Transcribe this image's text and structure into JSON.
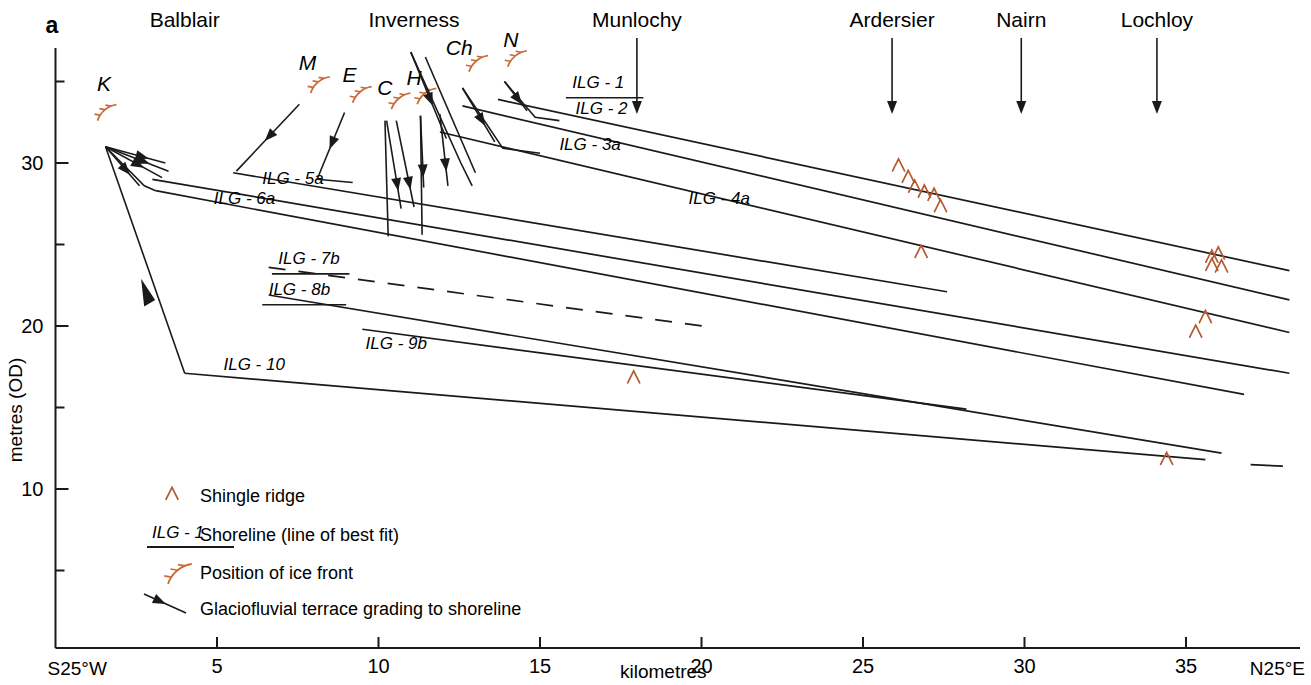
{
  "panel_label": "a",
  "axes": {
    "y_axis_title": "metres (OD)",
    "x_axis_title": "kilometres",
    "x_start_label": "S25°W",
    "x_end_label": "N25°E",
    "y_ticks_major": [
      30,
      20,
      10
    ],
    "y_ticks_minor": [
      35,
      25,
      15,
      5
    ],
    "x_ticks_major": [
      5,
      10,
      15,
      20,
      25,
      30,
      35
    ],
    "x_range": [
      0,
      39
    ],
    "y_range": [
      2,
      37
    ]
  },
  "locations": [
    {
      "name": "Balblair",
      "x_km": 4.0,
      "arrow": false
    },
    {
      "name": "Inverness",
      "x_km": 11.1,
      "arrow": false
    },
    {
      "name": "Munlochy",
      "x_km": 18.0,
      "arrow": true
    },
    {
      "name": "Ardersier",
      "x_km": 25.9,
      "arrow": true
    },
    {
      "name": "Nairn",
      "x_km": 29.9,
      "arrow": true
    },
    {
      "name": "Lochloy",
      "x_km": 34.1,
      "arrow": true
    }
  ],
  "ice_fronts": [
    {
      "label": "K",
      "x_km": 1.3,
      "y_m": 32.6
    },
    {
      "label": "M",
      "x_km": 7.9,
      "y_m": 34.3
    },
    {
      "label": "E",
      "x_km": 9.2,
      "y_m": 33.7
    },
    {
      "label": "C",
      "x_km": 10.4,
      "y_m": 33.3
    },
    {
      "label": "H",
      "x_km": 11.2,
      "y_m": 33.6
    },
    {
      "label": "Ch",
      "x_km": 12.8,
      "y_m": 35.6
    },
    {
      "label": "N",
      "x_km": 14.0,
      "y_m": 35.9
    }
  ],
  "shorelines": [
    {
      "label": "ILG - 1",
      "label_x_km": 16.0,
      "style": "solid"
    },
    {
      "label": "ILG - 2",
      "label_x_km": 16.2,
      "style": "solid"
    },
    {
      "label": "ILG - 3a",
      "label_x_km": 15.6,
      "style": "solid"
    },
    {
      "label": "ILG - 4a",
      "label_x_km": 19.5,
      "style": "solid"
    },
    {
      "label": "ILG - 5a",
      "label_x_km": 7.0,
      "style": "solid"
    },
    {
      "label": "ILG - 6a",
      "label_x_km": 5.5,
      "style": "solid"
    },
    {
      "label": "ILG - 7b",
      "label_x_km": 7.5,
      "style": "dashed"
    },
    {
      "label": "ILG - 8b",
      "label_x_km": 7.5,
      "style": "solid"
    },
    {
      "label": "ILG - 9b",
      "label_x_km": 10.0,
      "style": "solid"
    },
    {
      "label": "ILG - 10",
      "label_x_km": 5.5,
      "style": "solid"
    }
  ],
  "legend": [
    {
      "symbol": "shingle-ridge",
      "text": "Shingle ridge"
    },
    {
      "symbol": "shoreline-line",
      "text": "Shoreline (line of best fit)",
      "sample_label": "ILG - 1"
    },
    {
      "symbol": "ice-front",
      "text": "Position of ice front"
    },
    {
      "symbol": "terrace-arrow",
      "text": "Glaciofluvial terrace grading to shoreline"
    }
  ],
  "colors": {
    "ink": "#1a1a1a",
    "shingle": "#b5592f",
    "ice_front": "#c96a3a",
    "background": "#ffffff"
  },
  "chart_data": {
    "type": "line",
    "title": "",
    "xlabel": "kilometres",
    "ylabel": "metres (OD)",
    "xlim": [
      0,
      39
    ],
    "ylim": [
      2,
      37
    ],
    "grid": false,
    "legend_position": "lower-left",
    "series": [
      {
        "name": "ILG - 1",
        "style": "solid",
        "points": [
          [
            13.7,
            33.9
          ],
          [
            38.2,
            23.4
          ]
        ]
      },
      {
        "name": "ILG - 2",
        "style": "solid",
        "points": [
          [
            12.6,
            33.5
          ],
          [
            38.2,
            21.6
          ]
        ]
      },
      {
        "name": "ILG - 3a",
        "style": "solid",
        "points": [
          [
            11.9,
            31.9
          ],
          [
            38.2,
            19.6
          ]
        ]
      },
      {
        "name": "ILG - 4a",
        "style": "solid",
        "points": [
          [
            3.0,
            29.0
          ],
          [
            38.2,
            17.1
          ]
        ]
      },
      {
        "name": "ILG - 5a",
        "style": "solid",
        "points": [
          [
            5.5,
            29.4
          ],
          [
            27.6,
            22.1
          ]
        ]
      },
      {
        "name": "ILG - 6a",
        "style": "solid",
        "points": [
          [
            3.1,
            28.3
          ],
          [
            36.8,
            15.8
          ]
        ]
      },
      {
        "name": "ILG - 7b",
        "style": "dashed",
        "points": [
          [
            6.6,
            23.6
          ],
          [
            20.4,
            19.9
          ]
        ]
      },
      {
        "name": "ILG - 8b",
        "style": "solid",
        "points": [
          [
            6.6,
            21.9
          ],
          [
            36.1,
            12.2
          ]
        ]
      },
      {
        "name": "ILG - 9b",
        "style": "solid",
        "points": [
          [
            9.5,
            19.8
          ],
          [
            28.2,
            14.9
          ]
        ]
      },
      {
        "name": "ILG - 10",
        "style": "solid",
        "points": [
          [
            4.0,
            17.1
          ],
          [
            35.6,
            11.8
          ]
        ]
      }
    ],
    "shingle_ridges": [
      [
        26.1,
        29.9
      ],
      [
        26.4,
        29.2
      ],
      [
        26.6,
        28.6
      ],
      [
        26.9,
        28.3
      ],
      [
        27.2,
        28.1
      ],
      [
        27.4,
        27.4
      ],
      [
        26.8,
        24.6
      ],
      [
        17.9,
        16.9
      ],
      [
        35.8,
        24.3
      ],
      [
        36.0,
        24.5
      ],
      [
        35.8,
        23.8
      ],
      [
        36.1,
        23.7
      ],
      [
        35.6,
        20.6
      ],
      [
        35.3,
        19.7
      ],
      [
        34.4,
        11.9
      ]
    ]
  }
}
